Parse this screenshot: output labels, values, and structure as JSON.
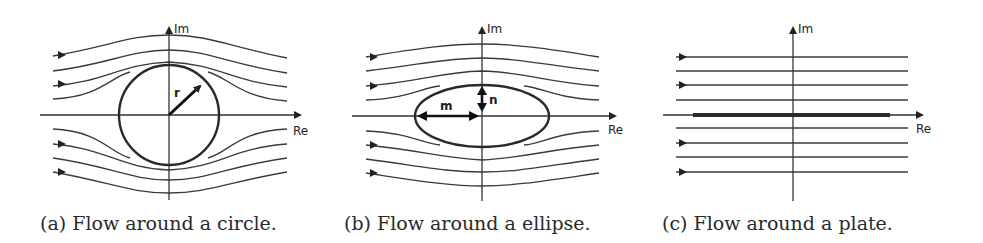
{
  "figure": {
    "panels": [
      {
        "id": "a",
        "caption": "(a) Flow around a circle.",
        "shape": "circle",
        "dimension_labels": [
          "r"
        ],
        "axis_labels": {
          "x": "Re",
          "y": "Im"
        }
      },
      {
        "id": "b",
        "caption": "(b) Flow around a ellipse.",
        "shape": "ellipse",
        "dimension_labels": [
          "m",
          "n"
        ],
        "axis_labels": {
          "x": "Re",
          "y": "Im"
        }
      },
      {
        "id": "c",
        "caption": "(c) Flow around a plate.",
        "shape": "plate",
        "dimension_labels": [],
        "axis_labels": {
          "x": "Re",
          "y": "Im"
        }
      }
    ],
    "colors": {
      "line": "#3a3a3a",
      "shape": "#2a2a2a",
      "background": "#ffffff"
    }
  }
}
